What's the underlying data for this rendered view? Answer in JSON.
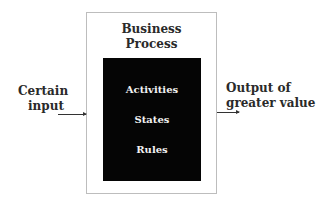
{
  "diagram": {
    "process": {
      "title_line1": "Business",
      "title_line2": "Process",
      "items": [
        "Activities",
        "States",
        "Rules"
      ]
    },
    "input": {
      "line1": "Certain",
      "line2": "input"
    },
    "output": {
      "line1": "Output of",
      "line2": "greater value"
    },
    "colors": {
      "inner_box": "#050505",
      "outer_border": "#bdbdbd",
      "text": "#2a2a2a"
    }
  }
}
